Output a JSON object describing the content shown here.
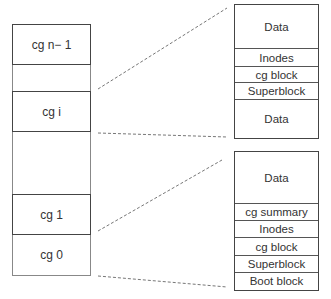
{
  "left_column": {
    "groups": [
      {
        "label": "cg n− 1"
      },
      {
        "label": "cg i"
      },
      {
        "label": "cg 1"
      },
      {
        "label": "cg 0"
      }
    ]
  },
  "upper_detail": {
    "rows": [
      {
        "label": "Data"
      },
      {
        "label": "Inodes"
      },
      {
        "label": "cg block"
      },
      {
        "label": "Superblock"
      },
      {
        "label": "Data"
      }
    ]
  },
  "lower_detail": {
    "rows": [
      {
        "label": "Data"
      },
      {
        "label": "cg summary"
      },
      {
        "label": "Inodes"
      },
      {
        "label": "cg block"
      },
      {
        "label": "Superblock"
      },
      {
        "label": "Boot block"
      }
    ]
  }
}
